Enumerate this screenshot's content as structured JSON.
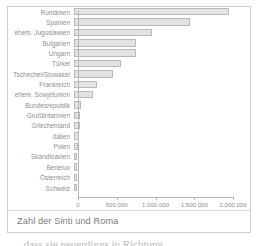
{
  "figure": {
    "caption": "Zahl der Sinti und Roma",
    "below_text": "… dass sie neuerdings in Richtung"
  },
  "chart_data": {
    "type": "bar",
    "orientation": "horizontal",
    "title": "Zahl der Sinti und Roma",
    "xlabel": "",
    "ylabel": "",
    "xlim": [
      0,
      2000000
    ],
    "grid": false,
    "legend": null,
    "tick_labels": [
      "0",
      "500.000",
      "1.000.000",
      "1.500.000",
      "2.000.000"
    ],
    "tick_values": [
      0,
      500000,
      1000000,
      1500000,
      2000000
    ],
    "categories": [
      "Rumänien",
      "Spanien",
      "ehem. Jugoslawien",
      "Bulgarien",
      "Ungarn",
      "Türkei",
      "Tschechei/Slowakei",
      "Frankreich",
      "ehem. Sowjetunion",
      "Bundesrepublik",
      "Großbritannien",
      "Griechenland",
      "Italien",
      "Polen",
      "Skandinavien",
      "Benelux",
      "Österreich",
      "Schweiz"
    ],
    "values": [
      2000000,
      1500000,
      1000000,
      800000,
      800000,
      600000,
      500000,
      300000,
      250000,
      90000,
      80000,
      80000,
      70000,
      50000,
      40000,
      35000,
      25000,
      20000
    ],
    "colors": {
      "bar_fill": "#e3e3e3",
      "bar_border": "#b9b9b9",
      "axis": "#b5b5b5",
      "text": "#8e8e8e",
      "frame": "#cfcfcf"
    }
  }
}
